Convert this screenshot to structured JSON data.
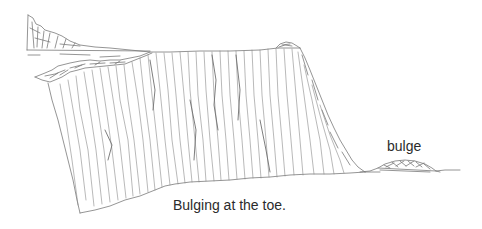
{
  "figure": {
    "type": "sketch-diagram",
    "labels": {
      "bulge": "bulge"
    },
    "caption": "Bulging at the toe.",
    "colors": {
      "background": "#ffffff",
      "line": "#7a7a7a",
      "text": "#2b2b2b"
    }
  }
}
